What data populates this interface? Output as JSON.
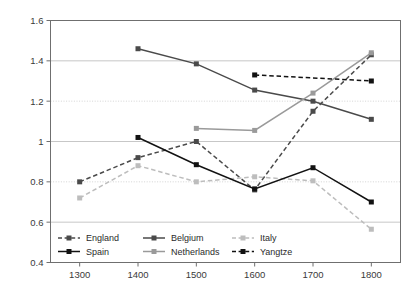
{
  "chart_data": {
    "type": "line",
    "title": "",
    "subtitle": "",
    "xlabel": "",
    "ylabel": "",
    "x": [
      1300,
      1400,
      1500,
      1600,
      1700,
      1800
    ],
    "xticklabels": [
      "1300",
      "1400",
      "1500",
      "1600",
      "1700",
      "1800"
    ],
    "yticklabels": [
      "0.4",
      "0.6",
      "0.8",
      "1",
      "1.2",
      "1.4",
      "1.6"
    ],
    "yticks": [
      0.4,
      0.6,
      0.8,
      1.0,
      1.2,
      1.4,
      1.6
    ],
    "xlim": [
      1250,
      1850
    ],
    "ylim": [
      0.4,
      1.6
    ],
    "grid": "horizontal",
    "legend_position": "inside-bottom-left",
    "series": [
      {
        "name": "England",
        "color": "#4a4a4a",
        "dash": "dashed",
        "marker": "square",
        "x": [
          1300,
          1400,
          1500,
          1600,
          1700,
          1800
        ],
        "values": [
          0.8,
          0.92,
          1.0,
          0.76,
          1.15,
          1.43
        ]
      },
      {
        "name": "Belgium",
        "color": "#4a4a4a",
        "dash": "solid",
        "marker": "square",
        "x": [
          1400,
          1500,
          1600,
          1700,
          1800
        ],
        "values": [
          1.46,
          1.385,
          1.255,
          1.2,
          1.11
        ]
      },
      {
        "name": "Italy",
        "color": "#bdbdbd",
        "dash": "dashed",
        "marker": "square",
        "x": [
          1300,
          1400,
          1500,
          1600,
          1700,
          1800
        ],
        "values": [
          0.72,
          0.88,
          0.8,
          0.825,
          0.805,
          0.565
        ]
      },
      {
        "name": "Spain",
        "color": "#121212",
        "dash": "solid",
        "marker": "square",
        "x": [
          1400,
          1500,
          1600,
          1700,
          1800
        ],
        "values": [
          1.02,
          0.885,
          0.765,
          0.87,
          0.7
        ]
      },
      {
        "name": "Netherlands",
        "color": "#9a9a9a",
        "dash": "solid",
        "marker": "square",
        "x": [
          1500,
          1600,
          1700,
          1800
        ],
        "values": [
          1.065,
          1.055,
          1.24,
          1.44
        ]
      },
      {
        "name": "Yangtze",
        "color": "#121212",
        "dash": "dashed",
        "marker": "square",
        "x": [
          1600,
          1800
        ],
        "values": [
          1.33,
          1.3
        ]
      }
    ],
    "legend": [
      {
        "label": "England",
        "color": "#4a4a4a",
        "dash": "dashed"
      },
      {
        "label": "Belgium",
        "color": "#4a4a4a",
        "dash": "solid"
      },
      {
        "label": "Italy",
        "color": "#bdbdbd",
        "dash": "dashed"
      },
      {
        "label": "Spain",
        "color": "#121212",
        "dash": "solid"
      },
      {
        "label": "Netherlands",
        "color": "#9a9a9a",
        "dash": "solid"
      },
      {
        "label": "Yangtze",
        "color": "#121212",
        "dash": "dashed"
      }
    ]
  }
}
